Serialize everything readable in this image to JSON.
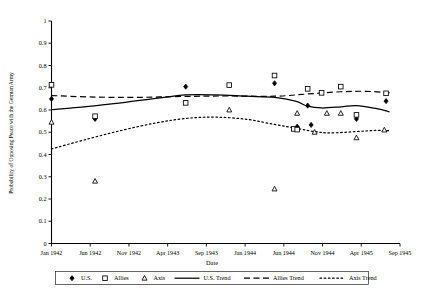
{
  "chart_data": {
    "type": "scatter",
    "title": "",
    "xlabel": "Date",
    "ylabel": "Probability of Opposing Peace with the German Army",
    "ylim": [
      0,
      1
    ],
    "ytick_labels": [
      "0",
      "0.1",
      "0.2",
      "0.3",
      "0.4",
      "0.5",
      "0.6",
      "0.7",
      "0.8",
      "0.9",
      "1"
    ],
    "ytick_values": [
      0,
      0.1,
      0.2,
      0.3,
      0.4,
      0.5,
      0.6,
      0.7,
      0.8,
      0.9,
      1
    ],
    "xtick_labels": [
      "Jan 1942",
      "Jun 1942",
      "Nov 1942",
      "Apr 1943",
      "Sep 1943",
      "Jan 1944",
      "Jun 1944",
      "Nov 1944",
      "Apr 1945",
      "Sep 1945"
    ],
    "grid": false,
    "legend_position": "bottom",
    "series": [
      {
        "name": "U.S.",
        "marker": "filled-diamond",
        "points": [
          {
            "x": 0.0,
            "y": 0.65
          },
          {
            "x": 0.125,
            "y": 0.56
          },
          {
            "x": 0.385,
            "y": 0.705
          },
          {
            "x": 0.64,
            "y": 0.72
          },
          {
            "x": 0.705,
            "y": 0.525
          },
          {
            "x": 0.745,
            "y": 0.533
          },
          {
            "x": 0.735,
            "y": 0.62
          },
          {
            "x": 0.875,
            "y": 0.56
          },
          {
            "x": 0.96,
            "y": 0.64
          }
        ]
      },
      {
        "name": "Allies",
        "marker": "open-square",
        "points": [
          {
            "x": 0.0,
            "y": 0.713
          },
          {
            "x": 0.125,
            "y": 0.572
          },
          {
            "x": 0.385,
            "y": 0.632
          },
          {
            "x": 0.51,
            "y": 0.712
          },
          {
            "x": 0.64,
            "y": 0.755
          },
          {
            "x": 0.695,
            "y": 0.515
          },
          {
            "x": 0.705,
            "y": 0.512
          },
          {
            "x": 0.735,
            "y": 0.695
          },
          {
            "x": 0.775,
            "y": 0.677
          },
          {
            "x": 0.83,
            "y": 0.705
          },
          {
            "x": 0.875,
            "y": 0.578
          },
          {
            "x": 0.96,
            "y": 0.675
          }
        ]
      },
      {
        "name": "Axis",
        "marker": "open-triangle",
        "points": [
          {
            "x": 0.0,
            "y": 0.545
          },
          {
            "x": 0.125,
            "y": 0.28
          },
          {
            "x": 0.51,
            "y": 0.6
          },
          {
            "x": 0.64,
            "y": 0.245
          },
          {
            "x": 0.705,
            "y": 0.585
          },
          {
            "x": 0.755,
            "y": 0.5
          },
          {
            "x": 0.79,
            "y": 0.585
          },
          {
            "x": 0.83,
            "y": 0.585
          },
          {
            "x": 0.875,
            "y": 0.475
          },
          {
            "x": 0.955,
            "y": 0.51
          }
        ]
      },
      {
        "name": "U.S. Trend",
        "line": "solid",
        "points": [
          {
            "x": 0.0,
            "y": 0.602
          },
          {
            "x": 0.1,
            "y": 0.615
          },
          {
            "x": 0.2,
            "y": 0.632
          },
          {
            "x": 0.3,
            "y": 0.652
          },
          {
            "x": 0.385,
            "y": 0.668
          },
          {
            "x": 0.47,
            "y": 0.668
          },
          {
            "x": 0.56,
            "y": 0.662
          },
          {
            "x": 0.64,
            "y": 0.657
          },
          {
            "x": 0.7,
            "y": 0.64
          },
          {
            "x": 0.735,
            "y": 0.617
          },
          {
            "x": 0.775,
            "y": 0.609
          },
          {
            "x": 0.83,
            "y": 0.614
          },
          {
            "x": 0.875,
            "y": 0.62
          },
          {
            "x": 0.93,
            "y": 0.607
          },
          {
            "x": 0.97,
            "y": 0.592
          }
        ]
      },
      {
        "name": "Allies Trend",
        "line": "dashed",
        "points": [
          {
            "x": 0.0,
            "y": 0.665
          },
          {
            "x": 0.125,
            "y": 0.658
          },
          {
            "x": 0.25,
            "y": 0.657
          },
          {
            "x": 0.385,
            "y": 0.661
          },
          {
            "x": 0.5,
            "y": 0.663
          },
          {
            "x": 0.64,
            "y": 0.662
          },
          {
            "x": 0.735,
            "y": 0.672
          },
          {
            "x": 0.83,
            "y": 0.682
          },
          {
            "x": 0.9,
            "y": 0.684
          },
          {
            "x": 0.97,
            "y": 0.678
          }
        ]
      },
      {
        "name": "Axis Trend",
        "line": "dotted",
        "points": [
          {
            "x": 0.0,
            "y": 0.425
          },
          {
            "x": 0.1,
            "y": 0.468
          },
          {
            "x": 0.2,
            "y": 0.508
          },
          {
            "x": 0.3,
            "y": 0.542
          },
          {
            "x": 0.385,
            "y": 0.562
          },
          {
            "x": 0.47,
            "y": 0.568
          },
          {
            "x": 0.56,
            "y": 0.558
          },
          {
            "x": 0.64,
            "y": 0.535
          },
          {
            "x": 0.705,
            "y": 0.517
          },
          {
            "x": 0.755,
            "y": 0.503
          },
          {
            "x": 0.8,
            "y": 0.497
          },
          {
            "x": 0.875,
            "y": 0.503
          },
          {
            "x": 0.93,
            "y": 0.508
          },
          {
            "x": 0.97,
            "y": 0.507
          }
        ]
      }
    ],
    "legend": [
      {
        "label": "U.S.",
        "marker": "filled-diamond"
      },
      {
        "label": "Allies",
        "marker": "open-square"
      },
      {
        "label": "Axis",
        "marker": "open-triangle"
      },
      {
        "label": "U.S. Trend",
        "marker": "solid-line"
      },
      {
        "label": "Allies Trend",
        "marker": "dashed-line"
      },
      {
        "label": "Axis Trend",
        "marker": "dotted-line"
      }
    ]
  }
}
